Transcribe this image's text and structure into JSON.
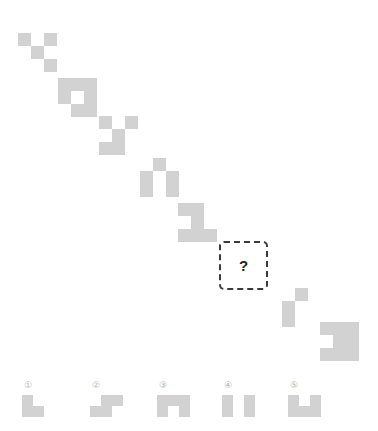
{
  "meta": {
    "puzzle_type": "visual-sequence-pattern",
    "cell_size_px": 13,
    "shape_color": "#d2d2d2",
    "background_color": "#ffffff",
    "label_color": "#b4b4b4",
    "question_border_color": "#3a3a3a",
    "question_mark_color": "#1e1e1e"
  },
  "sequence": {
    "name": "diagonal-shape-sequence",
    "items": [
      {
        "index": 1,
        "name": "sequence-shape-1",
        "x": 18,
        "y": 33,
        "cell": 13,
        "cells": [
          [
            0,
            0
          ],
          [
            2,
            0
          ],
          [
            1,
            1
          ],
          [
            2,
            2
          ]
        ]
      },
      {
        "index": 2,
        "name": "sequence-shape-2",
        "x": 58,
        "y": 78,
        "cell": 13,
        "cells": [
          [
            0,
            0
          ],
          [
            1,
            0
          ],
          [
            0,
            1
          ],
          [
            2,
            1
          ],
          [
            1,
            2
          ],
          [
            2,
            2
          ],
          [
            2,
            0
          ]
        ]
      },
      {
        "index": 3,
        "name": "sequence-shape-3",
        "x": 99,
        "y": 116,
        "cell": 13,
        "cells": [
          [
            0,
            0
          ],
          [
            2,
            0
          ],
          [
            1,
            1
          ],
          [
            0,
            2
          ],
          [
            1,
            2
          ]
        ]
      },
      {
        "index": 4,
        "name": "sequence-shape-4",
        "x": 140,
        "y": 158,
        "cell": 13,
        "cells": [
          [
            1,
            0
          ],
          [
            0,
            1
          ],
          [
            0,
            2
          ],
          [
            2,
            1
          ],
          [
            2,
            2
          ]
        ]
      },
      {
        "index": 5,
        "name": "sequence-shape-5",
        "x": 178,
        "y": 203,
        "cell": 13,
        "cells": [
          [
            0,
            0
          ],
          [
            1,
            0
          ],
          [
            1,
            1
          ],
          [
            0,
            2
          ],
          [
            1,
            2
          ],
          [
            2,
            2
          ]
        ]
      },
      {
        "index": 6,
        "name": "sequence-shape-6",
        "x": 282,
        "y": 288,
        "cell": 13,
        "cells": [
          [
            1,
            0
          ],
          [
            0,
            1
          ],
          [
            0,
            2
          ]
        ]
      },
      {
        "index": 7,
        "name": "sequence-shape-7",
        "x": 320,
        "y": 322,
        "cell": 13,
        "cells": [
          [
            0,
            0
          ],
          [
            1,
            0
          ],
          [
            2,
            0
          ],
          [
            1,
            1
          ],
          [
            2,
            1
          ],
          [
            0,
            2
          ],
          [
            1,
            2
          ],
          [
            2,
            2
          ]
        ]
      }
    ],
    "question": {
      "name": "question-placeholder",
      "label": "?",
      "x": 219,
      "y": 241,
      "width": 49,
      "height": 49
    }
  },
  "options": {
    "name": "answer-options",
    "items": [
      {
        "index": 1,
        "label": "①",
        "x": 22,
        "cell": 11,
        "cells": [
          [
            0,
            0
          ],
          [
            0,
            1
          ],
          [
            1,
            1
          ]
        ]
      },
      {
        "index": 2,
        "label": "②",
        "x": 90,
        "cell": 11,
        "cells": [
          [
            1,
            0
          ],
          [
            2,
            0
          ],
          [
            0,
            1
          ],
          [
            1,
            1
          ]
        ]
      },
      {
        "index": 3,
        "label": "③",
        "x": 157,
        "cell": 11,
        "cells": [
          [
            0,
            0
          ],
          [
            1,
            0
          ],
          [
            2,
            0
          ],
          [
            0,
            1
          ],
          [
            2,
            1
          ]
        ]
      },
      {
        "index": 4,
        "label": "④",
        "x": 222,
        "cell": 11,
        "cells": [
          [
            0,
            0
          ],
          [
            0,
            1
          ],
          [
            2,
            0
          ],
          [
            2,
            1
          ]
        ]
      },
      {
        "index": 5,
        "label": "⑤",
        "x": 288,
        "cell": 11,
        "cells": [
          [
            0,
            0
          ],
          [
            2,
            0
          ],
          [
            0,
            1
          ],
          [
            1,
            1
          ],
          [
            2,
            1
          ]
        ]
      }
    ]
  }
}
